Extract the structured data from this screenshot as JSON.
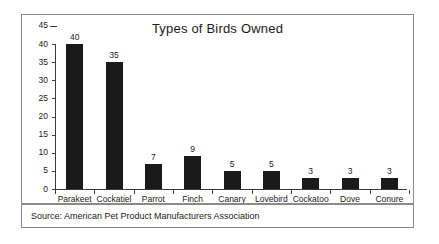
{
  "chart_data": {
    "type": "bar",
    "title": "Types of Birds Owned",
    "xlabel": "",
    "ylabel": "",
    "ylim": [
      0,
      45
    ],
    "ytick_step": 5,
    "yticks": [
      0,
      5,
      10,
      15,
      20,
      25,
      30,
      35,
      40,
      45
    ],
    "ytick_labels": [
      "0",
      "5",
      "10",
      "15",
      "20",
      "25",
      "30",
      "35",
      "40",
      "45"
    ],
    "categories": [
      "Parakeet",
      "Cockatiel",
      "Parrot",
      "Finch",
      "Canary",
      "Lovebird",
      "Cockatoo",
      "Dove",
      "Conure"
    ],
    "values": [
      40,
      35,
      7,
      9,
      5,
      5,
      3,
      3,
      3
    ],
    "value_labels": [
      "40",
      "35",
      "7",
      "9",
      "5",
      "5",
      "3",
      "3",
      "3"
    ],
    "grid": false,
    "legend": false,
    "bar_color": "#1a1a1a",
    "axis_color": "#3a3a3a",
    "border_color": "#8a8a8a"
  },
  "footer": {
    "source_text": "Source: American Pet Product Manufacturers Association"
  }
}
